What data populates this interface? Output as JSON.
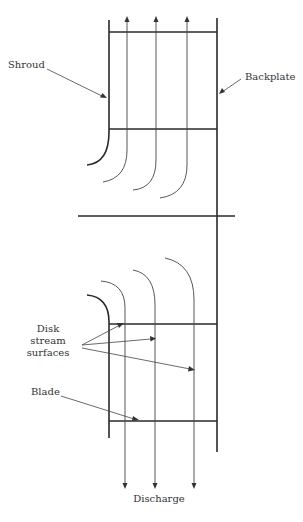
{
  "diagram": {
    "type": "impeller-meridional-section",
    "labels": {
      "shroud": "Shroud",
      "backplate": "Backplate",
      "disk_line1": "Disk",
      "disk_line2": "stream",
      "disk_line3": "surfaces",
      "blade": "Blade",
      "discharge": "Discharge"
    },
    "colors": {
      "line": "#2a2a2a",
      "text": "#333333",
      "background": "#ffffff"
    }
  }
}
